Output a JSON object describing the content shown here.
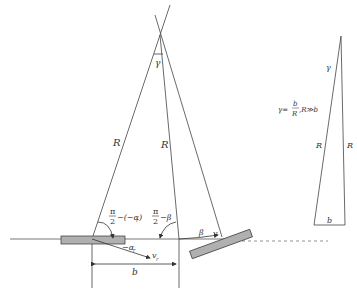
{
  "labels": {
    "gamma_apex": "γ",
    "R_left": "R",
    "R_middle": "R",
    "angle_left_num": "π",
    "angle_left_den": "2",
    "angle_left_rest": "−(−α",
    "angle_left_sub": "r",
    "angle_left_close": ")",
    "angle_mid_num": "π",
    "angle_mid_den": "2",
    "angle_mid_rest": "−β",
    "neg_alpha": "−α",
    "neg_alpha_sub": "r",
    "v_r": "v",
    "v_r_sub": "r",
    "beta": "β",
    "v": "v",
    "b_dim": "b"
  },
  "inset": {
    "gamma": "γ",
    "formula_lhs": "γ=",
    "formula_num": "b",
    "formula_den": "R",
    "formula_rest": ",R≫b",
    "R_left": "R",
    "R_right": "R",
    "b": "b"
  },
  "colors": {
    "line": "#444444",
    "block_fill": "#b0b0b0",
    "block_stroke": "#333333"
  }
}
